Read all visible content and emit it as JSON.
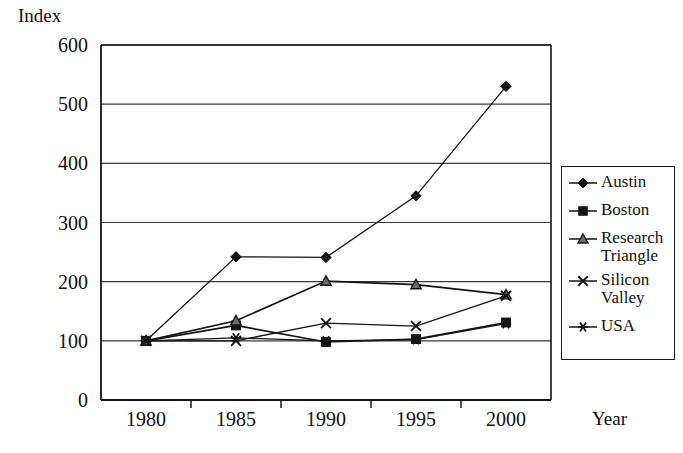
{
  "chart_data": {
    "type": "line",
    "title": "",
    "xlabel": "Year",
    "ylabel": "Index",
    "categories": [
      "1980",
      "1985",
      "1990",
      "1995",
      "2000"
    ],
    "ylim": [
      0,
      600
    ],
    "ytick_values": [
      0,
      100,
      200,
      300,
      400,
      500,
      600
    ],
    "ytick_labels": [
      "0",
      "100",
      "200",
      "300",
      "400",
      "500",
      "600"
    ],
    "grid": "horizontal",
    "legend_position": "right",
    "series": [
      {
        "name": "Austin",
        "marker": "diamond",
        "values": [
          100,
          242,
          241,
          345,
          530
        ]
      },
      {
        "name": "Boston",
        "marker": "square",
        "values": [
          100,
          126,
          98,
          103,
          131
        ]
      },
      {
        "name": "Research\nTriangle",
        "marker": "triangle",
        "values": [
          100,
          134,
          201,
          195,
          178
        ]
      },
      {
        "name": "Silicon\nValley",
        "marker": "cross",
        "values": [
          100,
          100,
          130,
          125,
          176
        ]
      },
      {
        "name": "USA",
        "marker": "asterisk",
        "values": [
          100,
          105,
          100,
          102,
          129
        ]
      }
    ]
  },
  "axes": {
    "ylabel_text": "Index",
    "xlabel_text": "Year"
  },
  "colors": {
    "line": "#141414",
    "axis": "#141414",
    "grid": "#3a3a3a",
    "background": "#ffffff"
  }
}
